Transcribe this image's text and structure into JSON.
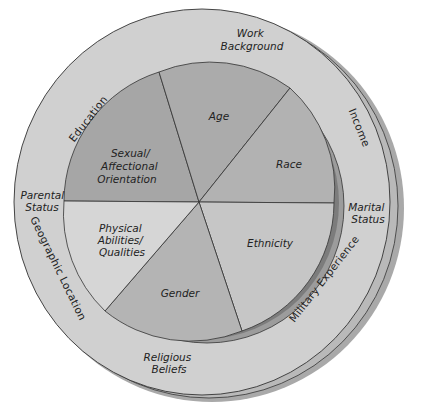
{
  "diagram": {
    "type": "diversity-wheel",
    "inner_dimensions": [
      {
        "key": "age",
        "lines": [
          "Age"
        ],
        "color": "#ababab"
      },
      {
        "key": "race",
        "lines": [
          "Race"
        ],
        "color": "#b2b2b2"
      },
      {
        "key": "ethnicity",
        "lines": [
          "Ethnicity"
        ],
        "color": "#c6c6c6"
      },
      {
        "key": "gender",
        "lines": [
          "Gender"
        ],
        "color": "#b4b4b4"
      },
      {
        "key": "physical",
        "lines": [
          "Physical",
          "Abilities/",
          "Qualities"
        ],
        "color": "#d6d6d6"
      },
      {
        "key": "sexual",
        "lines": [
          "Sexual/",
          "Affectional",
          "Orientation"
        ],
        "color": "#a6a6a6"
      }
    ],
    "outer_dimensions": [
      {
        "key": "work",
        "lines": [
          "Work",
          "Background"
        ]
      },
      {
        "key": "income",
        "lines": [
          "Income"
        ]
      },
      {
        "key": "marital",
        "lines": [
          "Marital",
          "Status"
        ]
      },
      {
        "key": "military",
        "lines": [
          "Military Experience"
        ]
      },
      {
        "key": "religious",
        "lines": [
          "Religious",
          "Beliefs"
        ]
      },
      {
        "key": "geographic",
        "lines": [
          "Geographic Location"
        ]
      },
      {
        "key": "parental",
        "lines": [
          "Parental",
          "Status"
        ]
      },
      {
        "key": "education",
        "lines": [
          "Education"
        ]
      }
    ],
    "colors": {
      "outer_ring": "#d0d0d0",
      "outer_shadow": "#9e9e9e",
      "inner_shadow": "#8a8a8a",
      "inner_band": "#a0a0a0",
      "outline": "#333333",
      "background": "#ffffff"
    }
  }
}
